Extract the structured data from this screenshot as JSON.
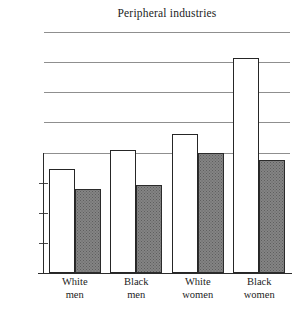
{
  "chart_data": {
    "type": "bar",
    "title": "Peripheral industries",
    "xlabel": "",
    "ylabel": "",
    "ylim": [
      0,
      80
    ],
    "ytick_values": [
      0,
      10,
      20,
      30,
      40,
      50,
      60,
      70,
      80
    ],
    "ytick_labels": [
      "0",
      "10%",
      "20%",
      "30%",
      "40%",
      "50%",
      "60%",
      "70%",
      "80%"
    ],
    "grid": true,
    "grid_axis": "y",
    "legend": false,
    "categories": [
      "White men",
      "Black men",
      "White women",
      "Black women"
    ],
    "category_lines": [
      {
        "line1": "White",
        "line2": "men"
      },
      {
        "line1": "Black",
        "line2": "men"
      },
      {
        "line1": "White",
        "line2": "women"
      },
      {
        "line1": "Black",
        "line2": "women"
      }
    ],
    "series": [
      {
        "name": "open",
        "style": "unfilled",
        "values": [
          34.5,
          40.8,
          46.3,
          71.5
        ]
      },
      {
        "name": "shaded",
        "style": "hatched-gray",
        "values": [
          28.0,
          29.3,
          40.0,
          37.5
        ]
      }
    ],
    "colors": {
      "open_bar_fill": "#ffffff",
      "open_bar_edge": "#262626",
      "shaded_bar_fill": "#848484",
      "shaded_bar_edge": "#2b2b2b",
      "gridline": "#8f8f8f",
      "axis": "#2b2b2b",
      "text": "#1c1c1c",
      "background": "#ffffff"
    }
  }
}
